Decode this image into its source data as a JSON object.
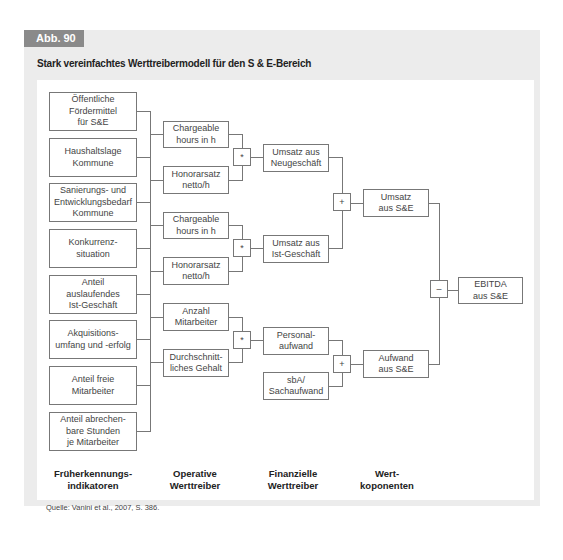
{
  "figure": {
    "label": "Abb. 90",
    "title": "Stark vereinfachtes Werttreibermodell für den S & E-Bereich",
    "source": "Quelle: Vanini et al., 2007, S. 386."
  },
  "columns": [
    {
      "label": "Früherkennungs-\nindikatoren"
    },
    {
      "label": "Operative\nWerttreiber"
    },
    {
      "label": "Finanzielle\nWerttreiber"
    },
    {
      "label": "Wert-\nkoponenten"
    }
  ],
  "early_indicators": [
    {
      "label": "Öffentliche\nFördermittel\nfür S&E"
    },
    {
      "label": "Haushaltslage\nKommune"
    },
    {
      "label": "Sanierungs- und\nEntwicklungsbedarf\nKommune"
    },
    {
      "label": "Konkurrenz-\nsituation"
    },
    {
      "label": "Anteil\nauslaufendes\nIst-Geschäft"
    },
    {
      "label": "Akquisitions-\numfang und -erfolg"
    },
    {
      "label": "Anteil freie\nMitarbeiter"
    },
    {
      "label": "Anteil abrechen-\nbare Stunden\nje Mitarbeiter"
    }
  ],
  "operative_drivers": [
    {
      "label": "Chargeable\nhours in h"
    },
    {
      "label": "Honorarsatz\nnetto/h"
    },
    {
      "label": "Chargeable\nhours in h"
    },
    {
      "label": "Honorarsatz\nnetto/h"
    },
    {
      "label": "Anzahl\nMitarbeiter"
    },
    {
      "label": "Durchschnitt-\nliches Gehalt"
    }
  ],
  "financial_drivers": [
    {
      "label": "Umsatz aus\nNeugeschäft"
    },
    {
      "label": "Umsatz aus\nIst-Geschäft"
    },
    {
      "label": "Personal-\naufwand"
    },
    {
      "label": "sbA/\nSachaufwand"
    }
  ],
  "value_components": [
    {
      "label": "Umsatz\naus S&E"
    },
    {
      "label": "Aufwand\naus S&E"
    }
  ],
  "result": {
    "label": "EBITDA\naus S&E"
  },
  "operators": {
    "mult1": "*",
    "mult2": "*",
    "mult3": "*",
    "plus_revenue": "+",
    "plus_expense": "+",
    "minus": "–"
  },
  "colors": {
    "frame_bg": "#ececec",
    "label_bg": "#8a8a8a",
    "line": "#777777"
  }
}
